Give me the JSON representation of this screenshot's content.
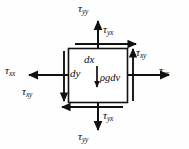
{
  "figure": {
    "type": "stress-element-free-body-diagram",
    "title": "",
    "element": {
      "shape": "square",
      "stroke_color": "#111111",
      "fill_color": "#ffffff",
      "box": {
        "x": 68,
        "y": 48,
        "w": 60,
        "h": 55
      }
    },
    "labels": {
      "tau_yy_top": {
        "sym": "τ",
        "sub": "yy"
      },
      "tau_yy_bottom": {
        "sym": "τ",
        "sub": "yy"
      },
      "tau_xx_left": {
        "sym": "τ",
        "sub": "xx"
      },
      "tau_xx_right": {
        "sym": "τ",
        "sub": "xx"
      },
      "tau_yx_top": {
        "sym": "τ",
        "sub": "yx"
      },
      "tau_yx_bottom": {
        "sym": "τ",
        "sub": "yx"
      },
      "tau_xy_right": {
        "sym": "τ",
        "sub": "xy"
      },
      "tau_xy_left": {
        "sym": "τ",
        "sub": "xy"
      },
      "dx": "dx",
      "dy": "dy",
      "body_force": "ρgdv"
    },
    "arrows": [
      {
        "name": "tau-yy-top-arrow",
        "dir": "up",
        "x1": 98,
        "y1": 48,
        "x2": 98,
        "y2": 20
      },
      {
        "name": "tau-yy-bottom-arrow",
        "dir": "down",
        "x1": 98,
        "y1": 103,
        "x2": 98,
        "y2": 131
      },
      {
        "name": "tau-xx-left-arrow",
        "dir": "left",
        "x1": 68,
        "y1": 75,
        "x2": 28,
        "y2": 75
      },
      {
        "name": "tau-xx-right-arrow",
        "dir": "right",
        "x1": 128,
        "y1": 75,
        "x2": 170,
        "y2": 75
      },
      {
        "name": "tau-yx-top-arrow",
        "dir": "right",
        "x1": 74,
        "y1": 44,
        "x2": 136,
        "y2": 44
      },
      {
        "name": "tau-yx-bottom-arrow",
        "dir": "left",
        "x1": 124,
        "y1": 107,
        "x2": 62,
        "y2": 107
      },
      {
        "name": "tau-xy-right-arrow",
        "dir": "up",
        "x1": 133,
        "y1": 100,
        "x2": 133,
        "y2": 48
      },
      {
        "name": "tau-xy-left-arrow",
        "dir": "down",
        "x1": 64,
        "y1": 52,
        "x2": 64,
        "y2": 100
      },
      {
        "name": "body-force-arrow",
        "dir": "down",
        "x1": 97,
        "y1": 68,
        "x2": 97,
        "y2": 88
      }
    ]
  }
}
